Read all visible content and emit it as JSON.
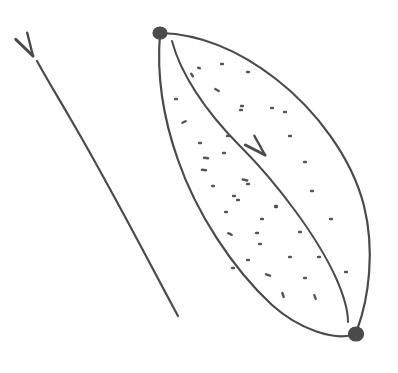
{
  "figure": {
    "canvas": {
      "width": 398,
      "height": 373,
      "background": "#ffffff"
    },
    "ink": {
      "line_color": "#4a4a4a",
      "dot_color": "#555555",
      "vertex_color": "#4b4b4b",
      "line_width": 2.1,
      "inner_line_width": 2.0,
      "stipple_width": 2.4
    },
    "vertices": [
      {
        "name": "top-vertex",
        "x": 160,
        "y": 33,
        "rx": 7.0,
        "ry": 6.0,
        "label": ""
      },
      {
        "name": "bottom-vertex",
        "x": 356,
        "y": 334,
        "rx": 7.5,
        "ry": 7.0,
        "label": ""
      }
    ],
    "curves": [
      {
        "name": "outer-boundary-left-arc",
        "path": "M 160 34 C 157 70, 161 112, 178 160 C 196 212, 232 268, 272 305 C 300 330, 334 340, 352 335",
        "width": 2.2
      },
      {
        "name": "outer-boundary-right-arc",
        "path": "M 161 33 C 196 34, 236 48, 276 79 C 316 110, 352 158, 364 206 C 375 250, 369 298, 357 330",
        "width": 2.2
      },
      {
        "name": "inner-arc",
        "path": "M 172 41 C 180 72, 204 110, 240 146 C 278 184, 318 238, 336 278 C 344 296, 348 312, 348 322",
        "width": 2.0
      },
      {
        "name": "free-arrow-shaft",
        "path": "M 178 316 C 152 268, 110 186, 70 118 C 56 94, 44 74, 37 61",
        "width": 2.2
      }
    ],
    "arrowheads": [
      {
        "name": "inner-arc-direction-arrowhead",
        "tip_x": 265,
        "tip_y": 155,
        "angle_deg": 224,
        "length": 22,
        "spread": 17,
        "description": "arrowhead on inner arc pointing up-left toward the top vertex"
      },
      {
        "name": "free-arrow-arrowhead",
        "tip_x": 33,
        "tip_y": 56,
        "angle_deg": 240,
        "length": 24,
        "spread": 16,
        "description": "arrowhead at top of the standalone arrow, pointing up-left"
      }
    ],
    "stipple": {
      "name": "interior-stipple-dots",
      "count": 42,
      "description": "small dots and short dashes filling the lens interior between the outer boundary and inner arc",
      "marks": [
        {
          "x": 199,
          "y": 68,
          "len": 2.0,
          "rot": 20
        },
        {
          "x": 222,
          "y": 64,
          "len": 1.8,
          "rot": 0
        },
        {
          "x": 192,
          "y": 75,
          "len": 3.0,
          "rot": 55
        },
        {
          "x": 248,
          "y": 72,
          "len": 1.8,
          "rot": 0
        },
        {
          "x": 217,
          "y": 90,
          "len": 4.0,
          "rot": 30
        },
        {
          "x": 176,
          "y": 99,
          "len": 1.8,
          "rot": 0
        },
        {
          "x": 241,
          "y": 110,
          "len": 1.8,
          "rot": 0
        },
        {
          "x": 184,
          "y": 122,
          "len": 3.6,
          "rot": 155
        },
        {
          "x": 242,
          "y": 106,
          "len": 2.0,
          "rot": 0
        },
        {
          "x": 272,
          "y": 108,
          "len": 1.8,
          "rot": 0
        },
        {
          "x": 285,
          "y": 112,
          "len": 1.8,
          "rot": 0
        },
        {
          "x": 200,
          "y": 143,
          "len": 1.8,
          "rot": 0
        },
        {
          "x": 228,
          "y": 136,
          "len": 1.8,
          "rot": 0
        },
        {
          "x": 290,
          "y": 136,
          "len": 1.8,
          "rot": 0
        },
        {
          "x": 206,
          "y": 158,
          "len": 4.0,
          "rot": 8
        },
        {
          "x": 224,
          "y": 153,
          "len": 1.8,
          "rot": 0
        },
        {
          "x": 305,
          "y": 162,
          "len": 1.8,
          "rot": 0
        },
        {
          "x": 245,
          "y": 180,
          "len": 4.5,
          "rot": 12
        },
        {
          "x": 248,
          "y": 184,
          "len": 2.0,
          "rot": 0
        },
        {
          "x": 204,
          "y": 170,
          "len": 4.2,
          "rot": 6
        },
        {
          "x": 234,
          "y": 196,
          "len": 1.8,
          "rot": 0
        },
        {
          "x": 238,
          "y": 200,
          "len": 1.8,
          "rot": 0
        },
        {
          "x": 276,
          "y": 207,
          "len": 1.8,
          "rot": 0
        },
        {
          "x": 312,
          "y": 191,
          "len": 1.8,
          "rot": 0
        },
        {
          "x": 262,
          "y": 219,
          "len": 1.8,
          "rot": 0
        },
        {
          "x": 226,
          "y": 212,
          "len": 1.8,
          "rot": 0
        },
        {
          "x": 230,
          "y": 234,
          "len": 3.8,
          "rot": 25
        },
        {
          "x": 276,
          "y": 206,
          "len": 1.8,
          "rot": 0
        },
        {
          "x": 300,
          "y": 232,
          "len": 1.8,
          "rot": 0
        },
        {
          "x": 331,
          "y": 219,
          "len": 1.8,
          "rot": 0
        },
        {
          "x": 257,
          "y": 233,
          "len": 1.8,
          "rot": 0
        },
        {
          "x": 248,
          "y": 260,
          "len": 1.8,
          "rot": 0
        },
        {
          "x": 290,
          "y": 257,
          "len": 1.8,
          "rot": 0
        },
        {
          "x": 319,
          "y": 257,
          "len": 1.8,
          "rot": 0
        },
        {
          "x": 268,
          "y": 275,
          "len": 4.2,
          "rot": 20
        },
        {
          "x": 233,
          "y": 268,
          "len": 1.8,
          "rot": 0
        },
        {
          "x": 305,
          "y": 278,
          "len": 1.8,
          "rot": 0
        },
        {
          "x": 283,
          "y": 295,
          "len": 4.2,
          "rot": 70
        },
        {
          "x": 315,
          "y": 297,
          "len": 4.0,
          "rot": 70
        },
        {
          "x": 346,
          "y": 272,
          "len": 1.8,
          "rot": 0
        },
        {
          "x": 260,
          "y": 244,
          "len": 1.8,
          "rot": 0
        },
        {
          "x": 213,
          "y": 186,
          "len": 1.8,
          "rot": 0
        }
      ]
    }
  }
}
